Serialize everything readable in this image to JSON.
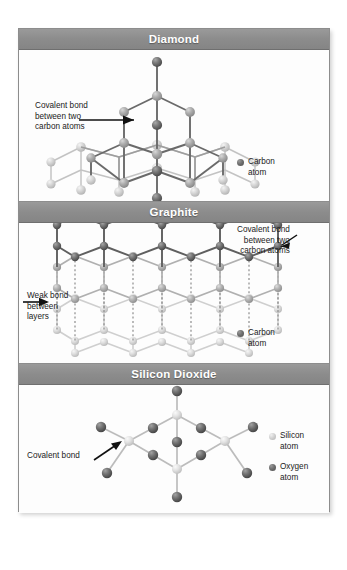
{
  "figure": {
    "panels": [
      {
        "id": "diamond",
        "title": "Diamond",
        "annotation": {
          "name": "covalent-bond-label",
          "lines": [
            "Covalent bond",
            "between two",
            "carbon atoms"
          ]
        },
        "legend": [
          {
            "swatch": "carbon",
            "lines": [
              "Carbon",
              "atom"
            ]
          }
        ]
      },
      {
        "id": "graphite",
        "title": "Graphite",
        "annotations": [
          {
            "name": "covalent-bond-label",
            "lines": [
              "Covalent bond",
              "between two",
              "carbon atoms"
            ]
          },
          {
            "name": "weak-bond-label",
            "lines": [
              "Weak bond",
              "between",
              "layers"
            ]
          }
        ],
        "legend": [
          {
            "swatch": "carbon",
            "lines": [
              "Carbon",
              "atom"
            ]
          }
        ]
      },
      {
        "id": "silicon-dioxide",
        "title": "Silicon Dioxide",
        "annotation": {
          "name": "covalent-bond-label",
          "lines": [
            "Covalent bond"
          ]
        },
        "legend": [
          {
            "swatch": "silicon",
            "lines": [
              "Silicon",
              "atom"
            ]
          },
          {
            "swatch": "oxygen",
            "lines": [
              "Oxygen",
              "atom"
            ]
          }
        ]
      }
    ]
  },
  "labels": {
    "diamond_title": "Diamond",
    "graphite_title": "Graphite",
    "silica_title": "Silicon Dioxide",
    "covalent_bond_l1": "Covalent bond",
    "covalent_bond_l2": "between two",
    "covalent_bond_l3": "carbon atoms",
    "weak_bond_l1": "Weak bond",
    "weak_bond_l2": "between",
    "weak_bond_l3": "layers",
    "covalent_bond_simple": "Covalent bond",
    "carbon_l1": "Carbon",
    "carbon_l2": "atom",
    "silicon_l1": "Silicon",
    "silicon_l2": "atom",
    "oxygen_l1": "Oxygen",
    "oxygen_l2": "atom"
  },
  "colors": {
    "header_bar": "#8c8c8c",
    "header_text": "#ffffff",
    "border": "#8d8d8d",
    "panel_bg": "#fdfdfd",
    "page_bg": "#ffffff",
    "carbon_dark": "#6f6f6f",
    "carbon_light": "#c8c8c8",
    "silicon": "#d8d8d8",
    "oxygen": "#6f6f6f",
    "bond_dark": "#5a5a5a",
    "bond_light": "#c0c0c0",
    "annotation_text": "#1b1b1b"
  }
}
